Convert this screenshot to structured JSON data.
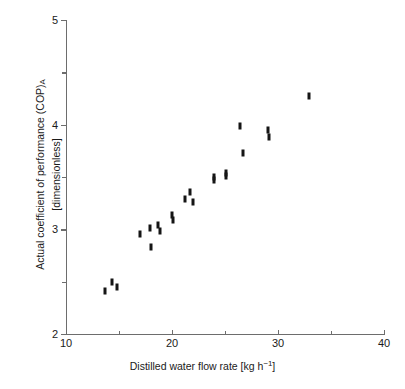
{
  "chart_data": {
    "type": "scatter",
    "title": "",
    "xlabel": "Distilled water flow rate [kg h⁻¹]",
    "ylabel": "Actual coefficient of performance (COP)ₐ [dimensionless]",
    "xlim": [
      10,
      40
    ],
    "ylim": [
      2,
      5
    ],
    "grid": false,
    "legend": null,
    "xticks": [
      10,
      20,
      30,
      40
    ],
    "xtick_labels": [
      "10",
      "20",
      "30",
      "40"
    ],
    "xticks_minor": [
      15,
      25,
      35
    ],
    "yticks": [
      2,
      3,
      4,
      5
    ],
    "ytick_labels": [
      "2",
      "3",
      "4",
      "5"
    ],
    "yticks_minor": [
      2.5,
      3.5,
      4.5
    ],
    "marker": "filled-rectangle",
    "marker_color": "#151515",
    "axis_color": "#6d6d6d",
    "x": [
      13.7,
      14.35,
      14.8,
      17.0,
      17.9,
      18.05,
      18.7,
      18.85,
      20.0,
      20.05,
      21.2,
      21.7,
      22.0,
      23.95,
      24.0,
      25.05,
      25.1,
      26.45,
      26.7,
      29.1,
      29.15,
      32.95
    ],
    "y": [
      2.41,
      2.5,
      2.45,
      2.96,
      3.01,
      2.83,
      3.04,
      2.98,
      3.14,
      3.09,
      3.29,
      3.36,
      3.26,
      3.5,
      3.47,
      3.51,
      3.54,
      3.99,
      3.73,
      3.95,
      3.88,
      4.27
    ],
    "points": [
      {
        "x": 13.7,
        "y": 2.41
      },
      {
        "x": 14.35,
        "y": 2.5
      },
      {
        "x": 14.8,
        "y": 2.45
      },
      {
        "x": 17.0,
        "y": 2.96
      },
      {
        "x": 17.9,
        "y": 3.01
      },
      {
        "x": 18.05,
        "y": 2.83
      },
      {
        "x": 18.7,
        "y": 3.04
      },
      {
        "x": 18.85,
        "y": 2.98
      },
      {
        "x": 20.0,
        "y": 3.14
      },
      {
        "x": 20.05,
        "y": 3.09
      },
      {
        "x": 21.2,
        "y": 3.29
      },
      {
        "x": 21.7,
        "y": 3.36
      },
      {
        "x": 22.0,
        "y": 3.26
      },
      {
        "x": 23.95,
        "y": 3.5
      },
      {
        "x": 24.0,
        "y": 3.47
      },
      {
        "x": 25.05,
        "y": 3.51
      },
      {
        "x": 25.1,
        "y": 3.54
      },
      {
        "x": 26.45,
        "y": 3.99
      },
      {
        "x": 26.7,
        "y": 3.73
      },
      {
        "x": 29.1,
        "y": 3.95
      },
      {
        "x": 29.15,
        "y": 3.88
      },
      {
        "x": 32.95,
        "y": 4.27
      }
    ]
  },
  "axes": {
    "y_title_line1": "Actual coefficient of performance (COP)",
    "y_title_sub": "A",
    "y_title_line2": "[dimensionless]",
    "x_title_main": "Distilled water flow rate [kg h",
    "x_title_sup": "−1",
    "x_title_tail": "]"
  }
}
